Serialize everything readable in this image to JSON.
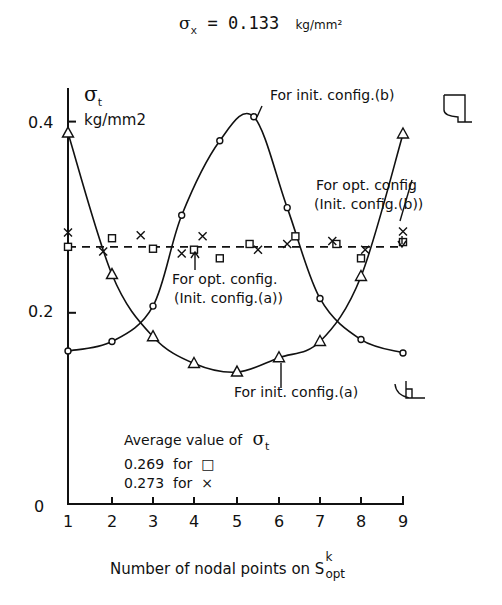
{
  "chart_data": {
    "type": "line",
    "title": "σx = 0.133 kg/mm²",
    "title_parts": {
      "symbol": "σ",
      "subscript": "x",
      "equals": "= 0.133",
      "unit": "kg/mm²"
    },
    "xlabel": "Number of nodal points on S opt k",
    "xlabel_parts": {
      "text": "Number of nodal points on S",
      "sup": "k",
      "sub": "opt"
    },
    "ylabel": "σt kg/mm2",
    "ylabel_parts": {
      "symbol": "σ",
      "subscript": "t",
      "unit": "kg/mm2"
    },
    "xlim": [
      1,
      9
    ],
    "ylim": [
      0,
      0.45
    ],
    "x_ticks": [
      1,
      2,
      3,
      4,
      5,
      6,
      7,
      8,
      9
    ],
    "x_tick_labels": [
      "1",
      "2",
      "3",
      "4",
      "5",
      "6",
      "7",
      "8",
      "9"
    ],
    "y_ticks": [
      0,
      0.2,
      0.4
    ],
    "y_tick_labels": [
      "0",
      "0.2",
      "0.4"
    ],
    "grid": false,
    "series": [
      {
        "name": "For init. config.(b)",
        "marker": "circle",
        "style": "solid",
        "x": [
          1,
          2,
          3,
          3.7,
          4.6,
          5.4,
          6.2,
          7.0,
          8,
          9
        ],
        "values": [
          0.16,
          0.17,
          0.207,
          0.302,
          0.38,
          0.405,
          0.31,
          0.215,
          0.172,
          0.158
        ]
      },
      {
        "name": "For init. config.(a)",
        "marker": "triangle",
        "style": "solid",
        "x": [
          1,
          2,
          3,
          4,
          5,
          6,
          7,
          8,
          9
        ],
        "values": [
          0.388,
          0.24,
          0.175,
          0.147,
          0.138,
          0.153,
          0.17,
          0.238,
          0.387
        ]
      },
      {
        "name": "For opt. config.(Init. config.(a))",
        "marker": "square",
        "style": "none",
        "x": [
          1,
          2,
          3,
          4,
          4.6,
          5.3,
          6.4,
          7.4,
          8.0,
          9
        ],
        "values": [
          0.269,
          0.278,
          0.267,
          0.266,
          0.257,
          0.272,
          0.28,
          0.272,
          0.257,
          0.274
        ]
      },
      {
        "name": "For opt. config(Init. config.(b))",
        "marker": "cross",
        "style": "none",
        "x": [
          1,
          1.8,
          2.7,
          3.7,
          4.2,
          5.5,
          6.2,
          7.3,
          8.1,
          9
        ],
        "values": [
          0.284,
          0.264,
          0.281,
          0.262,
          0.28,
          0.266,
          0.272,
          0.275,
          0.266,
          0.285
        ]
      },
      {
        "name": "Average (dashed)",
        "marker": "none",
        "style": "dashed",
        "x": [
          1,
          9
        ],
        "values": [
          0.269,
          0.269
        ]
      }
    ],
    "annotations": [
      {
        "text": "For init. config.(b)",
        "points_to": [
          5.4,
          0.405
        ]
      },
      {
        "text": "For opt. config (Init. config.(b))",
        "points_to": [
          9,
          0.285
        ]
      },
      {
        "text": "For opt. config. (Init. config.(a))",
        "points_to": [
          4.0,
          0.266
        ]
      },
      {
        "text": "For init. config.(a)",
        "points_to": [
          6.0,
          0.153
        ]
      },
      {
        "text": "Average value of σt"
      },
      {
        "text": "0.269 for □"
      },
      {
        "text": "0.273 for ×"
      }
    ],
    "averages": [
      {
        "value": 0.269,
        "marker": "square"
      },
      {
        "value": 0.273,
        "marker": "cross"
      }
    ]
  },
  "labels": {
    "title_sigma": "σ",
    "title_sub": "x",
    "title_eq": "= 0.133",
    "title_unit": "kg/mm²",
    "y_sigma": "σ",
    "y_sub": "t",
    "y_unit": "kg/mm2",
    "ann_b": "For init. config.(b)",
    "ann_opt_b_1": "For opt. config",
    "ann_opt_b_2": "(Init. config.(b))",
    "ann_opt_a_1": "For opt. config.",
    "ann_opt_a_2": "(Init. config.(a))",
    "ann_a": "For init. config.(a)",
    "avg_title": "Average value of",
    "avg_sigma": "σ",
    "avg_sub": "t",
    "avg_sq": "0.269  for  □",
    "avg_x": "0.273  for  ×",
    "xlabel_text": "Number of nodal points on S",
    "xlabel_sup": "k",
    "xlabel_sub": "opt",
    "y0": "0",
    "y02": "0.2",
    "y04": "0.4"
  }
}
